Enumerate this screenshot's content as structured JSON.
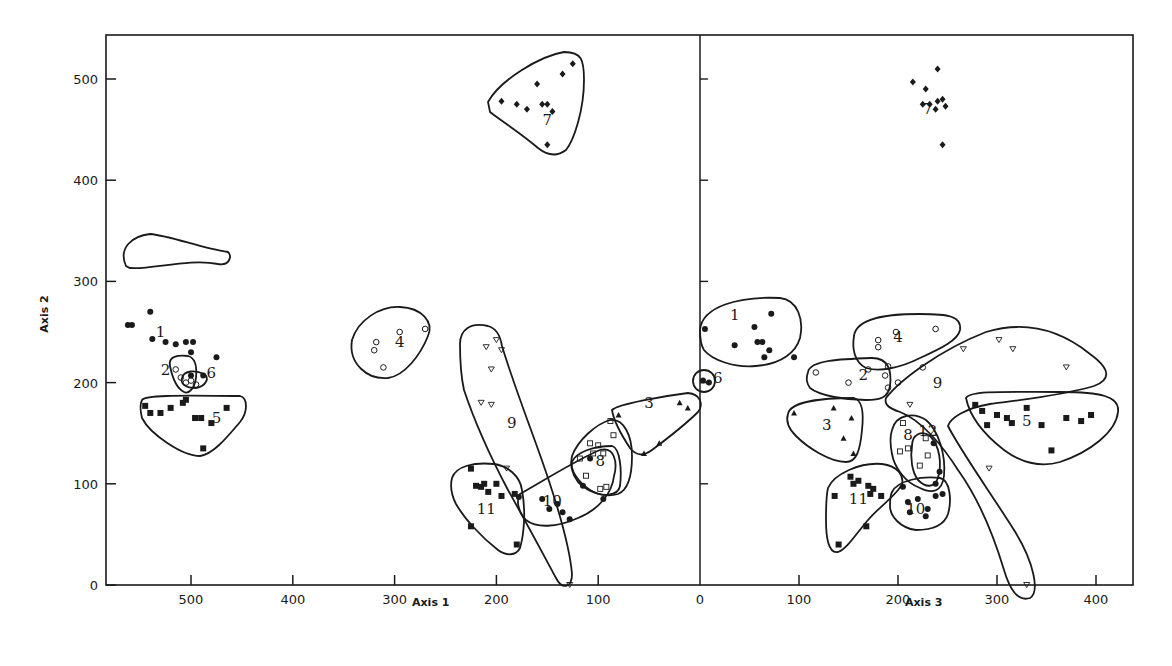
{
  "chart_data": [
    {
      "type": "scatter",
      "panel": "left",
      "title": "",
      "xlabel": "Axis 1",
      "ylabel": "Axis 2",
      "xlim": [
        580,
        0
      ],
      "ylim": [
        0,
        540
      ],
      "x_reversed": true,
      "xticks": [
        500,
        400,
        300,
        200,
        100,
        0
      ],
      "yticks": [
        0,
        100,
        200,
        300,
        400,
        500
      ],
      "grid": false,
      "legend": "none",
      "clusters": [
        {
          "id": "1",
          "marker": "filled-circle",
          "label_pos": [
            530,
            245
          ],
          "points": [
            [
              562,
              257
            ],
            [
              558,
              257
            ],
            [
              540,
              270
            ],
            [
              538,
              243
            ],
            [
              525,
              240
            ],
            [
              515,
              238
            ],
            [
              505,
              240
            ],
            [
              500,
              230
            ],
            [
              475,
              225
            ],
            [
              498,
              240
            ]
          ]
        },
        {
          "id": "2",
          "marker": "open-circle",
          "label_pos": [
            525,
            208
          ],
          "points": [
            [
              515,
              213
            ],
            [
              510,
              205
            ],
            [
              505,
              200
            ],
            [
              500,
              202
            ],
            [
              495,
              198
            ]
          ]
        },
        {
          "id": "6",
          "marker": "filled-circle",
          "label_pos": [
            480,
            205
          ],
          "points": [
            [
              500,
              207
            ],
            [
              488,
              207
            ]
          ]
        },
        {
          "id": "5",
          "marker": "filled-square",
          "label_pos": [
            475,
            160
          ],
          "points": [
            [
              545,
              177
            ],
            [
              540,
              170
            ],
            [
              530,
              170
            ],
            [
              520,
              175
            ],
            [
              508,
              180
            ],
            [
              505,
              183
            ],
            [
              496,
              165
            ],
            [
              490,
              165
            ],
            [
              480,
              160
            ],
            [
              465,
              175
            ],
            [
              488,
              135
            ]
          ]
        },
        {
          "id": "4",
          "marker": "open-circle",
          "label_pos": [
            295,
            235
          ],
          "points": [
            [
              318,
              240
            ],
            [
              320,
              232
            ],
            [
              295,
              250
            ],
            [
              270,
              253
            ],
            [
              311,
              215
            ]
          ]
        },
        {
          "id": "7",
          "marker": "filled-diamond",
          "label_pos": [
            150,
            455
          ],
          "points": [
            [
              195,
              478
            ],
            [
              180,
              475
            ],
            [
              170,
              470
            ],
            [
              160,
              495
            ],
            [
              155,
              475
            ],
            [
              150,
              475
            ],
            [
              145,
              468
            ],
            [
              135,
              505
            ],
            [
              125,
              515
            ],
            [
              150,
              435
            ]
          ]
        },
        {
          "id": "9",
          "marker": "open-triangle-down",
          "label_pos": [
            185,
            155
          ],
          "points": [
            [
              210,
              235
            ],
            [
              200,
              242
            ],
            [
              195,
              232
            ],
            [
              205,
              213
            ],
            [
              215,
              180
            ],
            [
              205,
              178
            ],
            [
              190,
              115
            ],
            [
              128,
              0
            ]
          ]
        },
        {
          "id": "3",
          "marker": "filled-triangle",
          "label_pos": [
            50,
            175
          ],
          "points": [
            [
              80,
              168
            ],
            [
              20,
              180
            ],
            [
              12,
              175
            ],
            [
              55,
              130
            ],
            [
              40,
              140
            ]
          ]
        },
        {
          "id": "8",
          "marker": "open-square",
          "label_pos": [
            98,
            118
          ],
          "points": [
            [
              88,
              162
            ],
            [
              85,
              148
            ],
            [
              108,
              140
            ],
            [
              100,
              138
            ],
            [
              105,
              130
            ],
            [
              95,
              130
            ],
            [
              118,
              125
            ],
            [
              112,
              108
            ],
            [
              92,
              97
            ],
            [
              98,
              95
            ]
          ]
        },
        {
          "id": "10",
          "marker": "filled-circle",
          "label_pos": [
            145,
            78
          ],
          "points": [
            [
              178,
              87
            ],
            [
              155,
              85
            ],
            [
              148,
              75
            ],
            [
              140,
              80
            ],
            [
              135,
              72
            ],
            [
              128,
              65
            ],
            [
              115,
              98
            ],
            [
              108,
              125
            ],
            [
              95,
              85
            ]
          ]
        },
        {
          "id": "11",
          "marker": "filled-square",
          "label_pos": [
            210,
            70
          ],
          "points": [
            [
              225,
              115
            ],
            [
              220,
              98
            ],
            [
              215,
              97
            ],
            [
              212,
              100
            ],
            [
              208,
              92
            ],
            [
              200,
              100
            ],
            [
              195,
              88
            ],
            [
              182,
              90
            ],
            [
              180,
              40
            ],
            [
              225,
              58
            ]
          ]
        }
      ]
    },
    {
      "type": "scatter",
      "panel": "right",
      "title": "",
      "xlabel": "Axis 3",
      "ylabel": "Axis 2",
      "xlim": [
        0,
        440
      ],
      "ylim": [
        0,
        540
      ],
      "xticks": [
        100,
        200,
        300,
        400
      ],
      "yticks": [
        0,
        100,
        200,
        300,
        400,
        500
      ],
      "grid": false,
      "legend": "none",
      "clusters": [
        {
          "id": "1",
          "marker": "filled-circle",
          "label_pos": [
            35,
            262
          ],
          "points": [
            [
              5,
              253
            ],
            [
              35,
              237
            ],
            [
              55,
              255
            ],
            [
              58,
              240
            ],
            [
              63,
              240
            ],
            [
              70,
              232
            ],
            [
              72,
              268
            ],
            [
              65,
              225
            ],
            [
              95,
              225
            ]
          ]
        },
        {
          "id": "6",
          "marker": "filled-circle",
          "label_pos": [
            18,
            200
          ],
          "points": [
            [
              3,
              202
            ],
            [
              9,
              200
            ]
          ]
        },
        {
          "id": "2",
          "marker": "open-circle",
          "label_pos": [
            165,
            203
          ],
          "points": [
            [
              117,
              210
            ],
            [
              150,
              200
            ],
            [
              170,
              213
            ],
            [
              187,
              207
            ],
            [
              190,
              195
            ],
            [
              200,
              200
            ]
          ]
        },
        {
          "id": "4",
          "marker": "open-circle",
          "label_pos": [
            200,
            240
          ],
          "points": [
            [
              180,
              242
            ],
            [
              180,
              235
            ],
            [
              198,
              250
            ],
            [
              238,
              253
            ],
            [
              225,
              215
            ],
            [
              190,
              216
            ]
          ]
        },
        {
          "id": "3",
          "marker": "filled-triangle",
          "label_pos": [
            128,
            153
          ],
          "points": [
            [
              95,
              170
            ],
            [
              135,
              175
            ],
            [
              153,
              165
            ],
            [
              145,
              145
            ],
            [
              155,
              130
            ]
          ]
        },
        {
          "id": "7",
          "marker": "filled-diamond",
          "label_pos": [
            230,
            465
          ],
          "points": [
            [
              215,
              497
            ],
            [
              228,
              490
            ],
            [
              240,
              510
            ],
            [
              225,
              475
            ],
            [
              232,
              475
            ],
            [
              240,
              478
            ],
            [
              245,
              480
            ],
            [
              248,
              473
            ],
            [
              238,
              470
            ],
            [
              245,
              435
            ]
          ]
        },
        {
          "id": "9",
          "marker": "open-triangle-down",
          "label_pos": [
            240,
            195
          ],
          "points": [
            [
              266,
              233
            ],
            [
              302,
              242
            ],
            [
              316,
              233
            ],
            [
              370,
              215
            ],
            [
              212,
              178
            ],
            [
              292,
              115
            ],
            [
              330,
              0
            ]
          ]
        },
        {
          "id": "5",
          "marker": "filled-square",
          "label_pos": [
            330,
            157
          ],
          "points": [
            [
              278,
              178
            ],
            [
              285,
              172
            ],
            [
              290,
              158
            ],
            [
              300,
              168
            ],
            [
              315,
              160
            ],
            [
              330,
              175
            ],
            [
              345,
              158
            ],
            [
              370,
              165
            ],
            [
              385,
              162
            ],
            [
              395,
              168
            ],
            [
              355,
              133
            ],
            [
              310,
              165
            ]
          ]
        },
        {
          "id": "8",
          "marker": "open-square",
          "label_pos": [
            210,
            143
          ],
          "points": [
            [
              205,
              160
            ],
            [
              202,
              132
            ],
            [
              228,
              145
            ],
            [
              230,
              128
            ],
            [
              222,
              118
            ],
            [
              210,
              135
            ]
          ]
        },
        {
          "id": "12",
          "marker": "filled-circle",
          "label_pos": [
            230,
            147
          ],
          "points": [
            [
              236,
              140
            ],
            [
              242,
              112
            ],
            [
              238,
              100
            ]
          ]
        },
        {
          "id": "10",
          "marker": "filled-circle",
          "label_pos": [
            218,
            70
          ],
          "points": [
            [
              205,
              97
            ],
            [
              210,
              82
            ],
            [
              220,
              85
            ],
            [
              212,
              72
            ],
            [
              230,
              75
            ],
            [
              238,
              88
            ],
            [
              245,
              90
            ],
            [
              228,
              68
            ]
          ]
        },
        {
          "id": "11",
          "marker": "filled-square",
          "label_pos": [
            160,
            80
          ],
          "points": [
            [
              136,
              88
            ],
            [
              152,
              107
            ],
            [
              155,
              100
            ],
            [
              160,
              103
            ],
            [
              170,
              98
            ],
            [
              175,
              95
            ],
            [
              172,
              90
            ],
            [
              183,
              88
            ],
            [
              140,
              40
            ],
            [
              168,
              58
            ]
          ]
        }
      ]
    }
  ],
  "figure": {
    "left_panel": {
      "x_axis_label": "Axis 1",
      "y_axis_label": "Axis 2"
    },
    "right_panel": {
      "x_axis_label": "Axis 3"
    },
    "shared_y_tick_labels": [
      "0",
      "100",
      "200",
      "300",
      "400",
      "500"
    ],
    "left_x_tick_labels": [
      "500",
      "400",
      "300",
      "200",
      "100",
      "0"
    ],
    "right_x_tick_labels": [
      "100",
      "200",
      "300",
      "400"
    ],
    "ink_color": "#1a1a1a",
    "background_color": "#ffffff"
  }
}
